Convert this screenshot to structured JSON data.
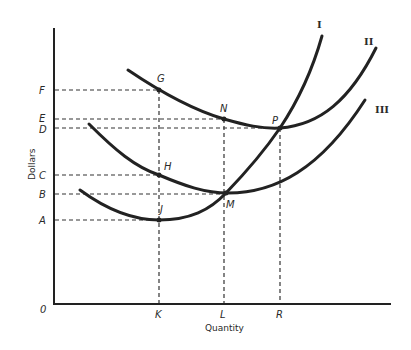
{
  "diagram": {
    "type": "cost-curves",
    "axes": {
      "x_label": "Quantity",
      "y_label": "Dollars",
      "origin_label": "0"
    },
    "y_ticks": [
      {
        "label": "F",
        "y": 90
      },
      {
        "label": "E",
        "y": 119
      },
      {
        "label": "D",
        "y": 128
      },
      {
        "label": "C",
        "y": 175
      },
      {
        "label": "B",
        "y": 194
      },
      {
        "label": "A",
        "y": 220
      }
    ],
    "x_ticks": [
      {
        "label": "K",
        "x": 159
      },
      {
        "label": "L",
        "x": 224
      },
      {
        "label": "R",
        "x": 280
      }
    ],
    "curves": [
      {
        "id": "I",
        "label": "I"
      },
      {
        "id": "II",
        "label": "II"
      },
      {
        "id": "III",
        "label": "III"
      }
    ],
    "points": {
      "G": "G",
      "N": "N",
      "P": "P",
      "H": "H",
      "M": "M",
      "J": "J"
    }
  }
}
